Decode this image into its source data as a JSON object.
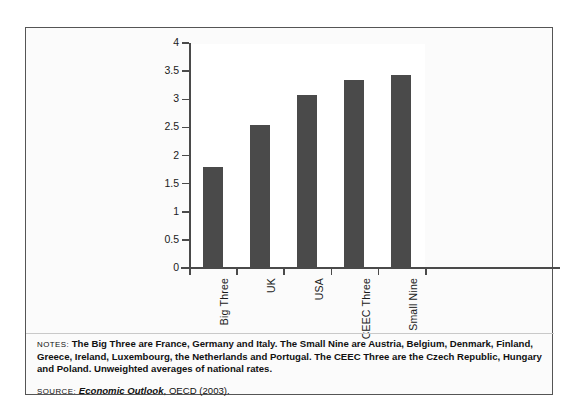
{
  "chart_data": {
    "type": "bar",
    "title": "",
    "xlabel": "",
    "ylabel": "",
    "categories": [
      "Big Three",
      "UK",
      "USA",
      "CEEC Three",
      "Small Nine"
    ],
    "values": [
      1.8,
      2.54,
      3.07,
      3.35,
      3.43
    ],
    "ylim": [
      0,
      4
    ],
    "yticks": [
      "0",
      "0.5",
      "1",
      "1.5",
      "2",
      "2.5",
      "3",
      "3.5",
      "4"
    ],
    "ytick_values": [
      0,
      0.5,
      1,
      1.5,
      2,
      2.5,
      3,
      3.5,
      4
    ],
    "grid": false,
    "legend": false,
    "bar_color": "#4a4a4a",
    "plot_background": "#ffffff"
  },
  "figure": {
    "notes_label": "NOTES:",
    "notes_text": "The Big Three are France, Germany and Italy. The Small Nine are Austria, Belgium, Denmark, Finland, Greece, Ireland, Luxembourg, the Netherlands and Portugal. The CEEC Three are the Czech Republic, Hungary and Poland. Unweighted averages of national rates.",
    "source_label": "SOURCE:",
    "source_title": "Economic Outlook",
    "source_rest": ", OECD (2003)."
  }
}
